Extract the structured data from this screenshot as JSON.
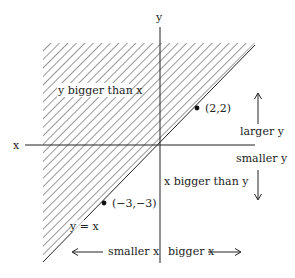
{
  "diagram": {
    "axes": {
      "x_label": "x",
      "y_label": "y"
    },
    "regions": {
      "upper": "y bigger than x",
      "lower": "x bigger than y"
    },
    "line_label": "y = x",
    "points": [
      {
        "label": "(2,2)"
      },
      {
        "label": "(−3,−3)"
      }
    ],
    "directions": {
      "larger_y": "larger y",
      "smaller_y": "smaller y",
      "smaller_x": "smaller x",
      "bigger_x": "bigger x"
    },
    "colors": {
      "ink": "#222222",
      "background": "#ffffff"
    }
  }
}
